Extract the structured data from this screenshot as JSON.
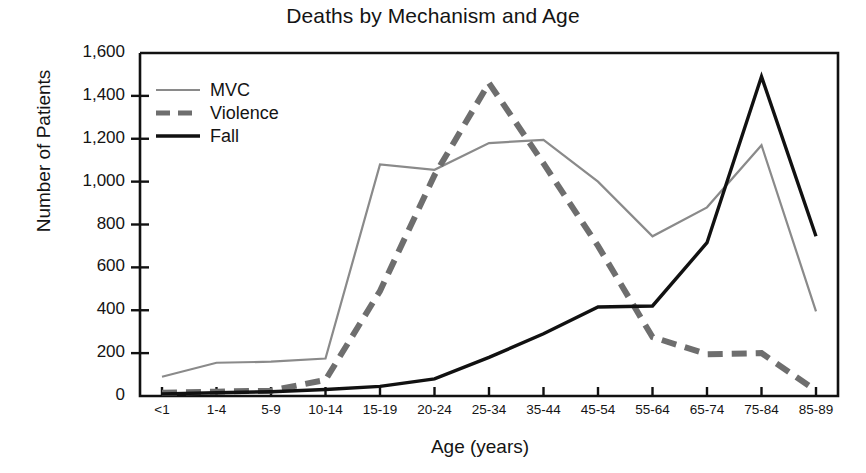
{
  "chart_data": {
    "type": "line",
    "title": "Deaths by Mechanism and Age",
    "xlabel": "Age (years)",
    "ylabel": "Number of Patients",
    "categories": [
      "<1",
      "1-4",
      "5-9",
      "10-14",
      "15-19",
      "20-24",
      "25-34",
      "35-44",
      "45-54",
      "55-64",
      "65-74",
      "75-84",
      "85-89"
    ],
    "ylim": [
      0,
      1600
    ],
    "ytick_labels": [
      "0",
      "200",
      "400",
      "600",
      "800",
      "1,000",
      "1,200",
      "1,400",
      "1,600"
    ],
    "ytick_values": [
      0,
      200,
      400,
      600,
      800,
      1000,
      1200,
      1400,
      1600
    ],
    "grid": false,
    "legend_position": "upper-left-inside",
    "series": [
      {
        "name": "MVC",
        "style": "solid-thin",
        "color": "#8a8a8a",
        "values": [
          90,
          155,
          160,
          175,
          1080,
          1055,
          1180,
          1195,
          1000,
          745,
          880,
          1170,
          395
        ]
      },
      {
        "name": "Violence",
        "style": "dashed-thick",
        "color": "#6e6e6e",
        "values": [
          15,
          20,
          25,
          75,
          490,
          1030,
          1460,
          1085,
          700,
          275,
          195,
          200,
          25
        ]
      },
      {
        "name": "Fall",
        "style": "solid-thick",
        "color": "#111111",
        "values": [
          10,
          15,
          20,
          30,
          45,
          80,
          180,
          290,
          415,
          420,
          715,
          1490,
          745
        ]
      }
    ]
  },
  "legend": {
    "entries": [
      {
        "label": "MVC"
      },
      {
        "label": "Violence"
      },
      {
        "label": "Fall"
      }
    ]
  },
  "colors": {
    "mvc": "#8a8a8a",
    "violence": "#6e6e6e",
    "fall": "#111111",
    "axis": "#111111",
    "background": "#ffffff"
  }
}
